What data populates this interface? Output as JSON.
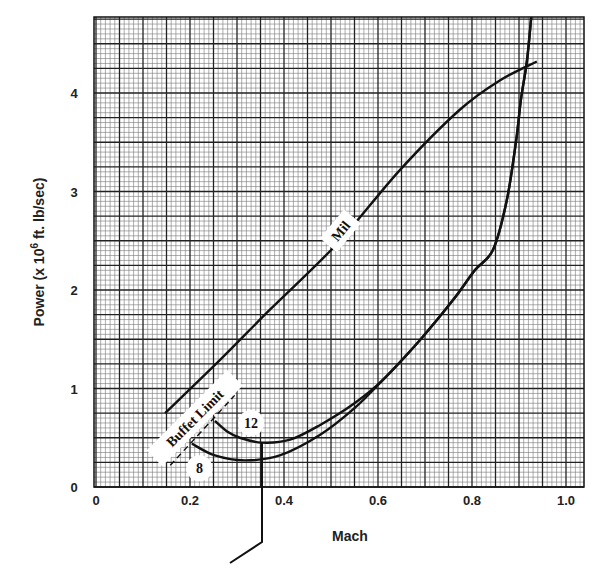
{
  "chart_data": {
    "type": "line",
    "title": "",
    "xlabel": "Mach",
    "ylabel": "Power (x 10^6 ft. lb/sec)",
    "ylabel_parts": {
      "prefix": "Power (x 10",
      "superscript": "6",
      "suffix": " ft. lb/sec)"
    },
    "xlim": [
      0,
      1.04
    ],
    "ylim": [
      0,
      4.76
    ],
    "x_ticks": [
      0,
      0.2,
      0.4,
      0.6,
      0.8,
      1.0
    ],
    "x_tick_labels": [
      "0",
      "0.2",
      "0.4",
      "0.6",
      "0.8",
      "1.0"
    ],
    "y_ticks": [
      0,
      1,
      2,
      3,
      4
    ],
    "y_tick_labels": [
      "0",
      "1",
      "2",
      "3",
      "4"
    ],
    "grid": {
      "on": true,
      "major_x_step": 0.05,
      "major_y_step": 0.25,
      "minor_subdivisions": 5
    },
    "legend": null,
    "series": [
      {
        "name": "Mil",
        "label": "Mil",
        "points": [
          [
            0.147,
            0.75
          ],
          [
            0.264,
            1.29
          ],
          [
            0.37,
            1.8
          ],
          [
            0.513,
            2.47
          ],
          [
            0.647,
            3.22
          ],
          [
            0.774,
            3.83
          ],
          [
            0.86,
            4.13
          ],
          [
            0.938,
            4.32
          ]
        ]
      },
      {
        "name": "12",
        "label": "12",
        "points": [
          [
            0.253,
            0.67
          ],
          [
            0.28,
            0.56
          ],
          [
            0.306,
            0.5
          ],
          [
            0.353,
            0.45
          ],
          [
            0.413,
            0.48
          ],
          [
            0.477,
            0.63
          ],
          [
            0.55,
            0.85
          ],
          [
            0.611,
            1.09
          ],
          [
            0.689,
            1.49
          ],
          [
            0.76,
            1.9
          ],
          [
            0.806,
            2.2
          ],
          [
            0.845,
            2.41
          ],
          [
            0.874,
            2.91
          ],
          [
            0.894,
            3.52
          ],
          [
            0.904,
            3.93
          ],
          [
            0.917,
            4.33
          ],
          [
            0.926,
            4.77
          ]
        ]
      },
      {
        "name": "8",
        "label": "8",
        "points": [
          [
            0.204,
            0.44
          ],
          [
            0.253,
            0.32
          ],
          [
            0.317,
            0.27
          ],
          [
            0.391,
            0.32
          ],
          [
            0.477,
            0.53
          ],
          [
            0.55,
            0.8
          ],
          [
            0.611,
            1.09
          ],
          [
            0.689,
            1.49
          ],
          [
            0.76,
            1.9
          ],
          [
            0.806,
            2.2
          ],
          [
            0.845,
            2.41
          ],
          [
            0.874,
            2.91
          ],
          [
            0.894,
            3.52
          ],
          [
            0.904,
            3.93
          ],
          [
            0.917,
            4.33
          ],
          [
            0.926,
            4.77
          ]
        ]
      },
      {
        "name": "Buffet Limit",
        "label": "Buffet Limit",
        "style": "dashed",
        "points": [
          [
            0.158,
            0.22
          ],
          [
            0.295,
            0.93
          ]
        ]
      }
    ],
    "annotations": [
      {
        "text": "Mil",
        "x": 0.52,
        "y": 2.6,
        "rotation": -50
      },
      {
        "text": "Buffet Limit",
        "x": 0.21,
        "y": 0.7,
        "rotation": -45
      },
      {
        "text": "12",
        "x": 0.33,
        "y": 0.65
      },
      {
        "text": "8",
        "x": 0.22,
        "y": 0.19
      }
    ],
    "leader_line": {
      "description": "pointer from curve-12 minimum down below axis",
      "points_px": [
        [
          262,
          443
        ],
        [
          262,
          542
        ],
        [
          230,
          563
        ]
      ]
    }
  }
}
